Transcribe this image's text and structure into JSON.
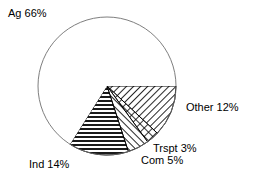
{
  "chart_data": {
    "type": "pie",
    "title": "",
    "subtitle": "",
    "xlabel": "",
    "ylabel": "",
    "legend_position": "none",
    "grid": false,
    "labels_as_drawn": [
      "Ag 66%",
      "Other 12%",
      "Trspt 3%",
      "Com 5%",
      "Ind 14%"
    ],
    "categories": [
      "Ag",
      "Other",
      "Trspt",
      "Com",
      "Ind"
    ],
    "values": [
      66,
      12,
      3,
      5,
      14
    ],
    "units": "percent",
    "total": 100,
    "slices": [
      {
        "name": "Ag",
        "label": "Ag 66%",
        "value": 66,
        "pattern": "solid-white",
        "start_angle_deg": 122.4,
        "end_angle_deg": 360.0
      },
      {
        "name": "Other",
        "label": "Other 12%",
        "value": 12,
        "pattern": "diagonal-hatch-backslash",
        "start_angle_deg": 0.0,
        "end_angle_deg": 43.2
      },
      {
        "name": "Trspt",
        "label": "Trspt 3%",
        "value": 3,
        "pattern": "cross-hatch",
        "start_angle_deg": 43.2,
        "end_angle_deg": 54.0
      },
      {
        "name": "Com",
        "label": "Com 5%",
        "value": 5,
        "pattern": "diagonal-hatch-slash",
        "start_angle_deg": 54.0,
        "end_angle_deg": 72.0
      },
      {
        "name": "Ind",
        "label": "Ind 14%",
        "value": 14,
        "pattern": "horizontal-lines",
        "start_angle_deg": 72.0,
        "end_angle_deg": 122.4
      }
    ],
    "geometry": {
      "center_x": 107,
      "center_y": 86,
      "radius": 69
    },
    "colors": {
      "outline": "#000000",
      "fill": "#ffffff",
      "hatch": "#000000",
      "text": "#000000"
    }
  }
}
